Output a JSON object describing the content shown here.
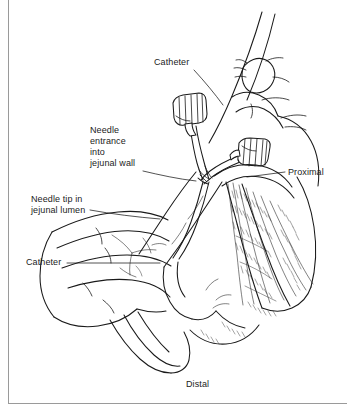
{
  "figure": {
    "background_color": "#ffffff",
    "ink_color": "#1a1a1a",
    "border_color": "#9a9a9a",
    "width": 347,
    "height": 412
  },
  "labels": {
    "catheter_top": "Catheter",
    "needle_entrance": "Needle\nentrance\ninto\njejunal wall",
    "needle_tip": "Needle tip in\njejunal lumen",
    "catheter_left": "Catheter",
    "proximal": "Proximal",
    "distal": "Distal"
  },
  "anatomy": {
    "parts": [
      "surgeon-upper-hand",
      "surgeon-lower-hand",
      "jejunal-loop",
      "mesentery",
      "mesenteric-vessels",
      "catheter-tubing",
      "catheter-hub-upper",
      "catheter-hub-lower",
      "needle-entry-point"
    ]
  }
}
